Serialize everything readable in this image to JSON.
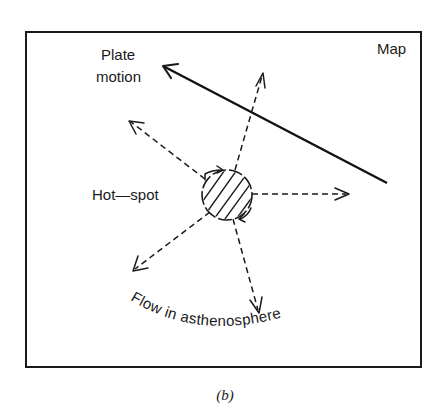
{
  "figure": {
    "panel_label": "Map",
    "caption": "(b)",
    "plate_motion": {
      "label_line1": "Plate",
      "label_line2": "motion"
    },
    "hot_spot": {
      "label": "Hot—spot"
    },
    "flow": {
      "label": "Flow in asthenosphere"
    }
  },
  "geometry": {
    "frame": {
      "x": 26,
      "y": 32,
      "width": 395,
      "height": 335
    },
    "plate_motion_arrow": {
      "from": [
        387,
        183
      ],
      "to": [
        162,
        65
      ]
    },
    "hot_spot_circle": {
      "cx": 227,
      "cy": 195,
      "r": 25
    },
    "flow_arrows": [
      {
        "name": "north",
        "from": [
          235,
          170
        ],
        "to": [
          263,
          73
        ]
      },
      {
        "name": "northwest",
        "from": [
          205,
          179
        ],
        "to": [
          129,
          121
        ]
      },
      {
        "name": "east",
        "from": [
          252,
          194
        ],
        "to": [
          349,
          194
        ]
      },
      {
        "name": "southwest",
        "from": [
          210,
          212
        ],
        "to": [
          133,
          271
        ]
      },
      {
        "name": "south",
        "from": [
          233,
          219
        ],
        "to": [
          259,
          313
        ]
      }
    ]
  },
  "colors": {
    "ink": "#1a1a1a",
    "background": "#ffffff"
  }
}
